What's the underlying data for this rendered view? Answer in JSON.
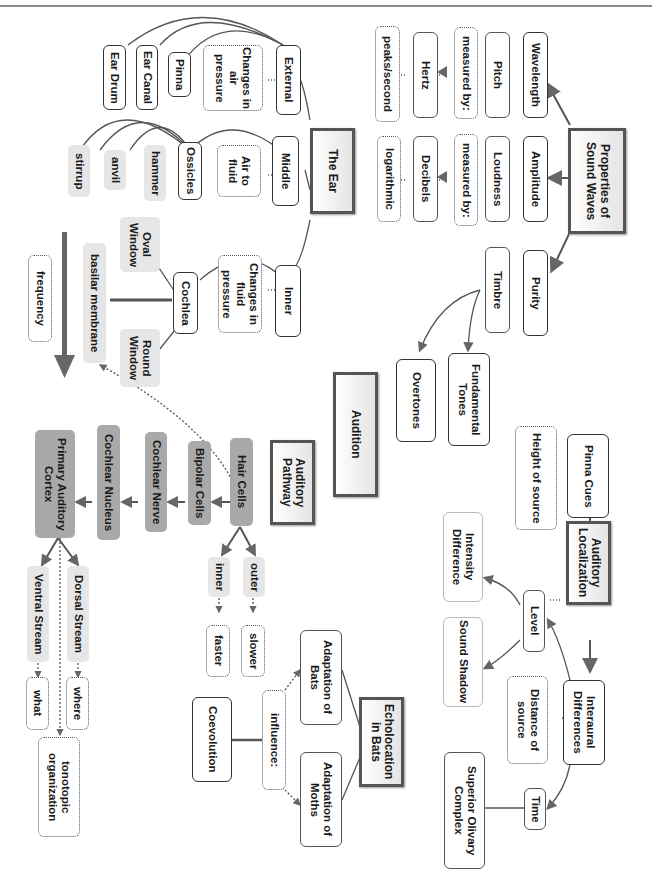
{
  "diagram": {
    "central_title": "Audition",
    "sections": {
      "sound_waves": {
        "title": "Properties of Sound Waves",
        "properties": [
          {
            "name": "Wavelength",
            "perceived": "Pitch",
            "relation": "measured by:",
            "unit": "Hertz",
            "note": "peaks/second"
          },
          {
            "name": "Amplitude",
            "perceived": "Loudness",
            "relation": "measured by:",
            "unit": "Decibels",
            "note": "logarithmic"
          },
          {
            "name": "Purity",
            "perceived": "Timbre",
            "children": [
              "Fundamental Tones",
              "Overtones"
            ]
          }
        ]
      },
      "ear": {
        "title": "The Ear",
        "external": {
          "label": "External",
          "note": "Changes in air pressure",
          "parts": [
            "Pinna",
            "Ear Canal",
            "Ear Drum"
          ]
        },
        "middle": {
          "label": "Middle",
          "note": "Air to fluid",
          "ossicles": "Ossicles",
          "bones": [
            "hammer",
            "anvil",
            "stirrup"
          ]
        },
        "inner": {
          "label": "Inner",
          "note": "Changes in fluid pressure",
          "cochlea": "Cochlea",
          "windows": [
            "Oval Window",
            "Round Window"
          ],
          "membrane": "basilar membrane",
          "frequency": "frequency"
        }
      },
      "pathway": {
        "title": "Auditory Pathway",
        "steps": [
          "Hair Cells",
          "Bipolar Cells",
          "Cochlear Nerve",
          "Cochlear Nucleus",
          "Primary Auditory Cortex"
        ],
        "hair_types": [
          {
            "name": "outer",
            "speed": "slower"
          },
          {
            "name": "inner",
            "speed": "faster"
          }
        ],
        "streams": [
          {
            "name": "Dorsal Stream",
            "role": "where"
          },
          {
            "name": "Ventral Stream",
            "role": "what"
          }
        ],
        "organization": "tonotopic organization"
      },
      "localization": {
        "title": "Auditory Localization",
        "pinna_cues": "Pinna Cues",
        "pinna_note": "Height of source",
        "interaural": "Interaural Differences",
        "interaural_note": "Distance of source",
        "level": "Level",
        "level_children": [
          "Intensity Difference",
          "Sound Shadow"
        ],
        "time": "Time",
        "time_child": "Superior Olivary Complex"
      },
      "echolocation": {
        "title": "Echolocation in Bats",
        "children": [
          "Adaptation of Bats",
          "Adaptation of Moths"
        ],
        "relation": "influence:",
        "result": "Coevolution"
      }
    }
  },
  "colors": {
    "line": "#555555",
    "gray_fill": "#e6e6e6",
    "dark_gray_fill": "#a9a9a9",
    "arrow": "#666666"
  }
}
